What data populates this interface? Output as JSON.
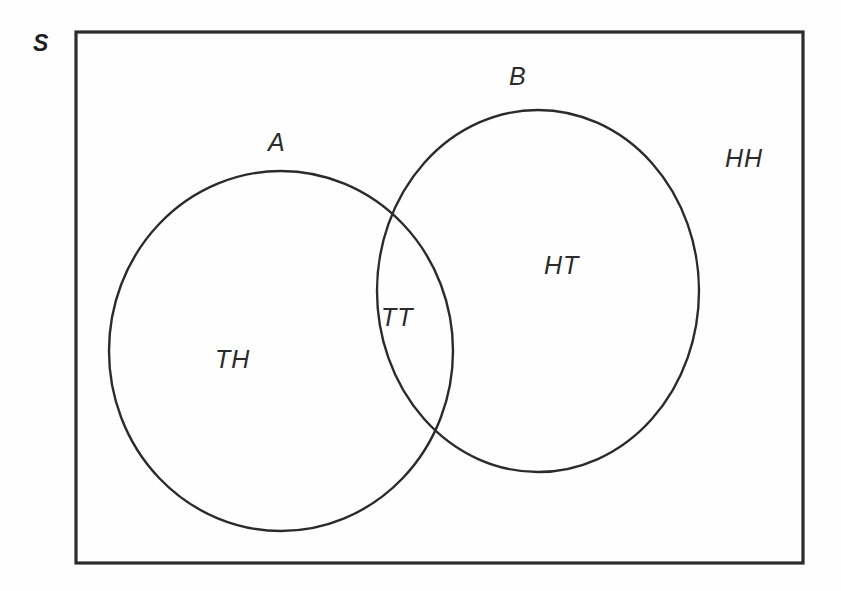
{
  "figure": {
    "type": "venn-diagram",
    "stroke_color": "#2b2b2b",
    "background_color": "#ffffff"
  },
  "universe": {
    "label": "S",
    "shape": "rectangle"
  },
  "sets": [
    {
      "id": "A",
      "label": "A",
      "shape": "circle"
    },
    {
      "id": "B",
      "label": "B",
      "shape": "circle"
    }
  ],
  "regions": [
    {
      "id": "a-only",
      "label": "TH",
      "region": "A only"
    },
    {
      "id": "intersection",
      "label": "TT",
      "region": "A intersect B"
    },
    {
      "id": "b-only",
      "label": "HT",
      "region": "B only"
    },
    {
      "id": "outside",
      "label": "HH",
      "region": "outside A and B"
    }
  ]
}
